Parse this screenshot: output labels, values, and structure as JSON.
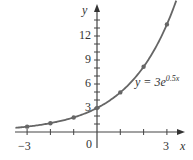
{
  "chart_data": {
    "type": "line",
    "title": "",
    "xlabel": "x",
    "ylabel": "y",
    "equation_label": "y = 3e^{0.5x}",
    "equation_parts": {
      "lhs": "y = 3",
      "base": "e",
      "exponent": "0.5x"
    },
    "xlim": [
      -3.3,
      3.4
    ],
    "ylim": [
      -0.6,
      15.8
    ],
    "x_ticks": [
      -3,
      -2,
      -1,
      0,
      1,
      2,
      3
    ],
    "x_tick_labels": [
      "-3",
      "0",
      "3"
    ],
    "x_tick_label_values": [
      -3,
      0,
      3
    ],
    "y_ticks": [
      1,
      2,
      3,
      4,
      5,
      6,
      7,
      8,
      9,
      10,
      11,
      12,
      13,
      14
    ],
    "y_tick_labels": [
      "3",
      "6",
      "9",
      "12"
    ],
    "y_tick_label_values": [
      3,
      6,
      9,
      12
    ],
    "grid": false,
    "series": [
      {
        "name": "y = 3e^{0.5x}",
        "function": "3*exp(0.5*x)",
        "x": [
          -3,
          -2,
          -1,
          0,
          1,
          2,
          3
        ],
        "values": [
          0.67,
          1.1,
          1.82,
          3.0,
          4.95,
          8.15,
          13.45
        ],
        "color": "#666666",
        "markers": true
      }
    ],
    "axis_color": "#333333"
  },
  "labels": {
    "x_axis": "x",
    "y_axis": "y",
    "origin": "0",
    "x_neg3": "−3",
    "x_pos3": "3",
    "y3": "3",
    "y6": "6",
    "y9": "9",
    "y12": "12",
    "eq_lhs": "y = 3",
    "eq_base": "e",
    "eq_exp": "0.5x"
  }
}
